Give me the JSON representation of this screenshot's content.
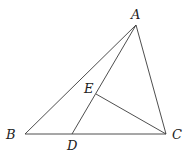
{
  "diagram": {
    "type": "geometry",
    "points": {
      "A": {
        "label": "A",
        "x": 136,
        "y": 25,
        "lx": 131,
        "ly": 19
      },
      "B": {
        "label": "B",
        "x": 25,
        "y": 134,
        "lx": 6,
        "ly": 139
      },
      "C": {
        "label": "C",
        "x": 166,
        "y": 134,
        "lx": 172,
        "ly": 139
      },
      "D": {
        "label": "D",
        "x": 72,
        "y": 134,
        "lx": 67,
        "ly": 150
      },
      "E": {
        "label": "E",
        "x": 96,
        "y": 94,
        "lx": 84,
        "ly": 93
      }
    },
    "segments": [
      {
        "name": "segment-ab",
        "from": "A",
        "to": "B"
      },
      {
        "name": "segment-ac",
        "from": "A",
        "to": "C"
      },
      {
        "name": "segment-bc",
        "from": "B",
        "to": "C"
      },
      {
        "name": "segment-ad",
        "from": "A",
        "to": "D"
      },
      {
        "name": "segment-ec",
        "from": "E",
        "to": "C"
      }
    ],
    "colors": {
      "stroke": "#3a3a3a",
      "label": "#222222",
      "background": "#ffffff"
    }
  }
}
